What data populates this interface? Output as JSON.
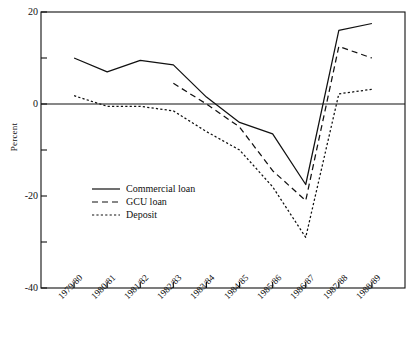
{
  "chart_data": {
    "type": "line",
    "title": "",
    "xlabel": "",
    "ylabel": "Percent",
    "categories": [
      "1979/80",
      "1980/81",
      "1981/82",
      "1982/83",
      "1983/84",
      "1984/85",
      "1985/86",
      "1986/87",
      "1987/88",
      "1988/89"
    ],
    "ylim": [
      -40,
      20
    ],
    "yticks": [
      20,
      0,
      -20,
      -40
    ],
    "ytick_labels": [
      "20",
      "0",
      "-20",
      "-40"
    ],
    "yminor_ticks": [
      10,
      -10,
      -30
    ],
    "grid": false,
    "zero_line": true,
    "legend_position": "center-left",
    "series": [
      {
        "name": "Commercial loan",
        "style": "solid",
        "color": "#111111",
        "values": [
          10.0,
          7.0,
          9.5,
          8.5,
          1.5,
          -4.0,
          -6.5,
          -17.5,
          16.0,
          17.5
        ]
      },
      {
        "name": "GCU loan",
        "style": "dashed",
        "color": "#111111",
        "values": [
          null,
          null,
          null,
          4.5,
          0.0,
          -5.0,
          -14.5,
          -21.0,
          12.5,
          10.0
        ]
      },
      {
        "name": "Deposit",
        "style": "dotted",
        "color": "#111111",
        "values": [
          1.8,
          -0.5,
          -0.5,
          -1.5,
          -6.0,
          -10.0,
          -18.0,
          -29.0,
          2.2,
          3.2
        ]
      }
    ]
  },
  "axis": {
    "y_title": "Percent"
  }
}
